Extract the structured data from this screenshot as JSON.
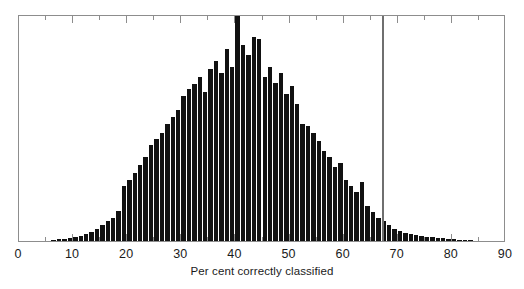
{
  "chart_data": {
    "type": "bar",
    "title": "",
    "subtitle": "",
    "xlabel": "Per cent correctly classified",
    "ylabel": "",
    "xlim": [
      0,
      90
    ],
    "ylim": [
      0,
      232
    ],
    "grid": false,
    "legend": null,
    "bin_width": 1,
    "xticks": [
      0,
      10,
      20,
      30,
      40,
      50,
      60,
      70,
      80,
      90
    ],
    "xtick_labels": [
      "0",
      "10",
      "20",
      "30",
      "40",
      "50",
      "60",
      "70",
      "80",
      "90"
    ],
    "minor_xticks": [
      5,
      15,
      25,
      35,
      45,
      55,
      65,
      75,
      85
    ],
    "bar_color": "#111111",
    "frame_color": "#8d8d8d",
    "annotations": [
      {
        "name": "observed-value-line",
        "type": "vertical-line",
        "x": 67.3,
        "color": "#6f6f6f"
      }
    ],
    "categories": [
      6,
      7,
      8,
      9,
      10,
      11,
      12,
      13,
      14,
      15,
      16,
      17,
      18,
      19,
      20,
      21,
      22,
      23,
      24,
      25,
      26,
      27,
      28,
      29,
      30,
      31,
      32,
      33,
      34,
      35,
      36,
      37,
      38,
      39,
      40,
      41,
      42,
      43,
      44,
      45,
      46,
      47,
      48,
      49,
      50,
      51,
      52,
      53,
      54,
      55,
      56,
      57,
      58,
      59,
      60,
      61,
      62,
      63,
      64,
      65,
      66,
      67,
      68,
      69,
      70,
      71,
      72,
      73,
      74,
      75,
      76,
      77,
      78,
      79,
      80,
      81,
      82,
      83
    ],
    "values": [
      1,
      2,
      2,
      3,
      4,
      5,
      7,
      9,
      12,
      16,
      20,
      24,
      31,
      56,
      62,
      70,
      78,
      86,
      98,
      104,
      110,
      120,
      127,
      134,
      148,
      155,
      160,
      168,
      152,
      176,
      184,
      172,
      196,
      178,
      232,
      200,
      190,
      208,
      206,
      168,
      178,
      162,
      172,
      150,
      158,
      140,
      120,
      118,
      110,
      102,
      92,
      86,
      76,
      80,
      62,
      56,
      50,
      60,
      36,
      30,
      24,
      20,
      16,
      12,
      10,
      8,
      7,
      6,
      5,
      4,
      4,
      3,
      3,
      2,
      2,
      1,
      1,
      1
    ]
  },
  "axis": {
    "x_title": "Per cent correctly classified"
  }
}
